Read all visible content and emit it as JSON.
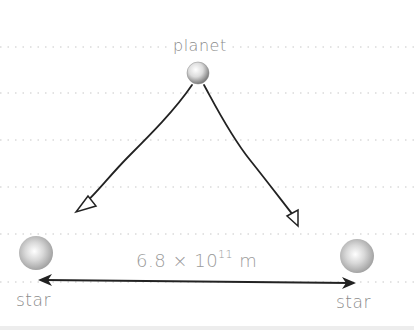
{
  "diagram": {
    "planet": {
      "label": "planet"
    },
    "stars": [
      {
        "label": "star",
        "position": "left"
      },
      {
        "label": "star",
        "position": "right"
      }
    ],
    "distance": {
      "mantissa": "6.8",
      "times": "×",
      "base": "10",
      "exponent": "11",
      "unit": "m"
    },
    "colors": {
      "line": "#222222",
      "label_text": "#8a8a8a",
      "dotted_rule": "#c8c8c8",
      "sphere_mid": "#c0c0c0"
    }
  }
}
